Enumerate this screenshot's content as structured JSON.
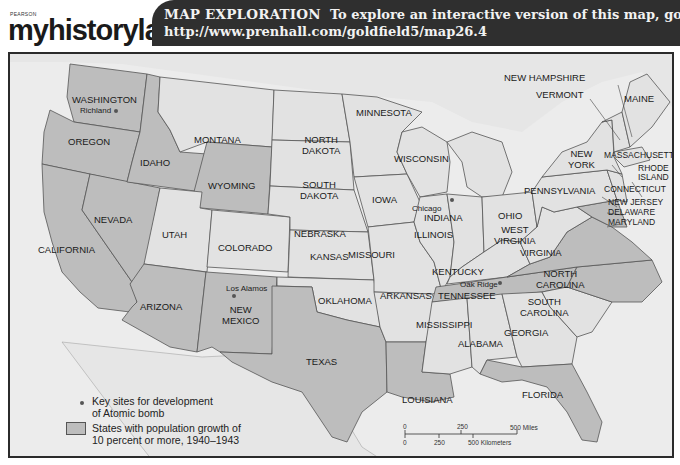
{
  "header": {
    "publisher": "PEARSON",
    "logo_text": "myhistorylab",
    "banner_lead": "MAP EXPLORATION",
    "banner_text": "To explore an interactive version of this map, go to",
    "banner_url": "http://www.prenhall.com/goldfield5/map26.4"
  },
  "colors": {
    "growth_state": "#bdbdbd",
    "other_state": "#e2e2e2",
    "ocean": "#ececec",
    "border": "#555555",
    "banner_bg": "#2f2f2f"
  },
  "states": {
    "washington": "WASHINGTON",
    "oregon": "OREGON",
    "california": "CALIFORNIA",
    "idaho": "IDAHO",
    "nevada": "NEVADA",
    "montana": "MONTANA",
    "wyoming": "WYOMING",
    "utah": "UTAH",
    "colorado": "COLORADO",
    "arizona": "ARIZONA",
    "new_mexico": "NEW\nMEXICO",
    "north_dakota": "NORTH\nDAKOTA",
    "south_dakota": "SOUTH\nDAKOTA",
    "nebraska": "NEBRASKA",
    "kansas": "KANSAS",
    "oklahoma": "OKLAHOMA",
    "texas": "TEXAS",
    "minnesota": "MINNESOTA",
    "iowa": "IOWA",
    "missouri": "MISSOURI",
    "arkansas": "ARKANSAS",
    "louisiana": "LOUISIANA",
    "wisconsin": "WISCONSIN",
    "illinois": "ILLINOIS",
    "indiana": "INDIANA",
    "ohio": "OHIO",
    "kentucky": "KENTUCKY",
    "tennessee": "TENNESSEE",
    "mississippi": "MISSISSIPPI",
    "alabama": "ALABAMA",
    "georgia": "GEORGIA",
    "florida": "FLORIDA",
    "south_carolina": "SOUTH\nCAROLINA",
    "north_carolina": "NORTH\nCAROLINA",
    "virginia": "VIRGINIA",
    "west_virginia": "WEST\nVIRGINIA",
    "pennsylvania": "PENNSYLVANIA",
    "new_york": "NEW\nYORK",
    "maine": "MAINE",
    "new_hampshire": "NEW HAMPSHIRE",
    "vermont": "VERMONT",
    "massachusetts": "MASSACHUSETTS",
    "rhode_island": "RHODE\nISLAND",
    "connecticut": "CONNECTICUT",
    "new_jersey": "NEW JERSEY",
    "delaware": "DELAWARE",
    "maryland": "MARYLAND"
  },
  "growth_states": [
    "Washington",
    "Oregon",
    "California",
    "Idaho",
    "Nevada",
    "Wyoming",
    "Arizona",
    "New Mexico",
    "Texas",
    "Louisiana",
    "Tennessee",
    "North Carolina",
    "Virginia",
    "Florida",
    "Maryland",
    "Delaware"
  ],
  "cities": {
    "richland": "Richland",
    "los_alamos": "Los Alamos",
    "chicago": "Chicago",
    "oak_ridge": "Oak Ridge"
  },
  "legend": {
    "key_sites": "Key sites for development of Atomic bomb",
    "key_sites_l1": "Key sites for development",
    "key_sites_l2": "of Atomic bomb",
    "growth_l1": "States with population growth of",
    "growth_l2": "10 percent or more, 1940–1943"
  },
  "scale": {
    "miles_0": "0",
    "miles_250": "250",
    "miles_500": "500 Miles",
    "km_0": "0",
    "km_250": "250",
    "km_500": "500 Kilometers"
  }
}
